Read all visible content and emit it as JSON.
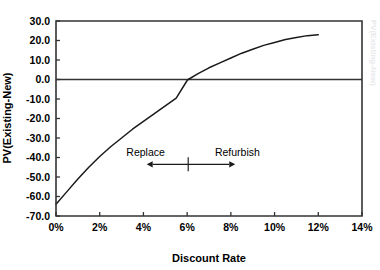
{
  "chart_data": {
    "type": "line",
    "title": "",
    "xlabel": "Discount Rate",
    "ylabel": "PV(Existing-New)",
    "xlim": [
      0,
      14
    ],
    "ylim": [
      -70,
      30
    ],
    "grid": false,
    "legend": "none",
    "x_tick_labels": [
      "0%",
      "2%",
      "4%",
      "6%",
      "8%",
      "10%",
      "12%",
      "14%"
    ],
    "x_tick_values": [
      0,
      2,
      4,
      6,
      8,
      10,
      12,
      14
    ],
    "y_tick_labels": [
      "30.0",
      "20.0",
      "10.0",
      "0.0",
      "-10.0",
      "-20.0",
      "-30.0",
      "-40.0",
      "-50.0",
      "-60.0",
      "-70.0"
    ],
    "y_tick_values": [
      30,
      20,
      10,
      0,
      -10,
      -20,
      -30,
      -40,
      -50,
      -60,
      -70
    ],
    "series": [
      {
        "name": "PV(Existing-New)",
        "color": "#1a1a1a",
        "x": [
          0,
          0.5,
          1,
          1.5,
          2,
          2.5,
          3,
          3.5,
          4,
          4.5,
          5,
          5.5,
          6,
          6.05,
          6.5,
          7,
          7.5,
          8,
          8.5,
          9,
          9.5,
          10,
          10.5,
          11,
          11.5,
          12
        ],
        "y": [
          -64.0,
          -57.5,
          -51.0,
          -45.0,
          -39.5,
          -34.5,
          -30.0,
          -25.5,
          -21.5,
          -17.5,
          -13.5,
          -9.5,
          -0.5,
          0.0,
          3.0,
          6.0,
          8.5,
          11.0,
          13.5,
          15.5,
          17.5,
          19.0,
          20.5,
          21.5,
          22.5,
          23.0
        ]
      }
    ],
    "zero_line": {
      "value": 0,
      "color": "#333333"
    },
    "annotations": [
      {
        "name": "replace",
        "label": "Replace",
        "x": 4.1,
        "y": -39.0,
        "arrow": "left",
        "arrow_from_x": 6.05,
        "arrow_to_x": 4.15,
        "arrow_y": -43.5
      },
      {
        "name": "refurbish",
        "label": "Refurbish",
        "x": 8.3,
        "y": -39.0,
        "arrow": "right",
        "arrow_from_x": 6.05,
        "arrow_to_x": 8.2,
        "arrow_y": -43.5
      },
      {
        "name": "divider",
        "label": "",
        "x": 6.05,
        "y": -43.5
      }
    ]
  },
  "axes": {
    "x_title": "Discount Rate",
    "y_title": "PV(Existing-New)"
  },
  "artifacts": {
    "right_bleed": "PV(Existing-New)"
  }
}
